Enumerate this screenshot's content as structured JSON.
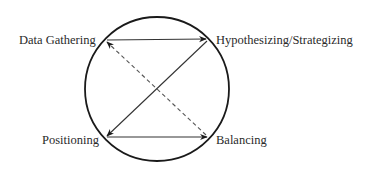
{
  "diagram": {
    "type": "cycle",
    "shape": "circle",
    "nodes": [
      {
        "id": "data_gathering",
        "label": "Data Gathering",
        "position": "top-left"
      },
      {
        "id": "hypothesizing",
        "label": "Hypothesizing/Strategizing",
        "position": "top-right"
      },
      {
        "id": "positioning",
        "label": "Positioning",
        "position": "bottom-left"
      },
      {
        "id": "balancing",
        "label": "Balancing",
        "position": "bottom-right"
      }
    ],
    "edges": [
      {
        "from": "data_gathering",
        "to": "hypothesizing",
        "style": "solid"
      },
      {
        "from": "hypothesizing",
        "to": "positioning",
        "style": "solid"
      },
      {
        "from": "positioning",
        "to": "balancing",
        "style": "solid"
      },
      {
        "from": "balancing",
        "to": "data_gathering",
        "style": "dashed"
      }
    ],
    "colors": {
      "circle": "#1a1a1a",
      "edge": "#333333",
      "dashed_edge": "#555555",
      "text": "#2a2a2a",
      "background": "#ffffff"
    }
  }
}
